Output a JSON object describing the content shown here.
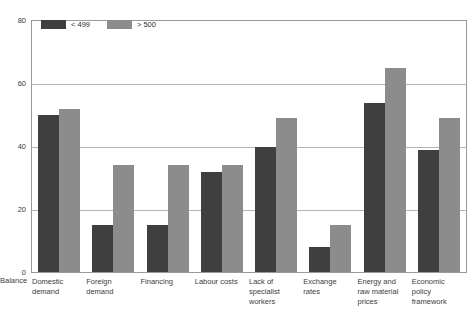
{
  "chart_data": {
    "type": "bar",
    "title": "",
    "xlabel": "",
    "ylabel": "Balance",
    "ylim": [
      0,
      80
    ],
    "yticks": [
      "0",
      "20",
      "40",
      "60",
      "80"
    ],
    "grid": true,
    "legend_position": "top-left",
    "categories": [
      "Domestic demand",
      "Foreign demand",
      "Financing",
      "Labour costs",
      "Lack of specialist workers",
      "Exchange rates",
      "Energy and raw material prices",
      "Economic policy framework"
    ],
    "series": [
      {
        "name": "< 499",
        "color": "#3f3f3f",
        "values": [
          50,
          15,
          15,
          32,
          40,
          8,
          54,
          39
        ]
      },
      {
        "name": "> 500",
        "color": "#8c8c8c",
        "values": [
          52,
          34,
          34,
          34,
          49,
          15,
          65,
          49
        ]
      }
    ]
  },
  "axis": {
    "y_title": "Balance",
    "ticks": [
      {
        "label": "80",
        "value": 80
      },
      {
        "label": "60",
        "value": 60
      },
      {
        "label": "40",
        "value": 40
      },
      {
        "label": "20",
        "value": 20
      },
      {
        "label": "0",
        "value": 0
      }
    ]
  },
  "legend": {
    "entries": [
      {
        "label": "< 499",
        "color": "#3f3f3f"
      },
      {
        "label": "> 500",
        "color": "#8c8c8c"
      }
    ]
  },
  "colors": {
    "series_dark": "#3f3f3f",
    "series_gray": "#8c8c8c",
    "gridline": "#b4b4b4",
    "frame": "#9a9a9a",
    "text": "#3c3c3c"
  }
}
